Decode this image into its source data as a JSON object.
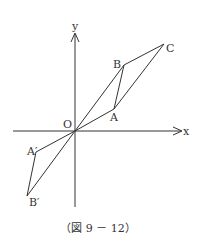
{
  "diagram": {
    "type": "coordinate-geometry",
    "caption": "（図 9 － 12）",
    "axes": {
      "x_label": "x",
      "y_label": "y",
      "origin_label": "O"
    },
    "points": {
      "A": {
        "label": "A",
        "px": [
          114,
          109
        ]
      },
      "B": {
        "label": "B",
        "px": [
          124,
          65
        ]
      },
      "C": {
        "label": "C",
        "px": [
          164,
          44
        ]
      },
      "A_prime": {
        "label": "A′",
        "px": [
          36,
          152
        ]
      },
      "B_prime": {
        "label": "B′",
        "px": [
          27,
          196
        ]
      },
      "O": {
        "label": "O",
        "px": [
          75,
          131
        ]
      }
    },
    "segments": [
      [
        "O",
        "A"
      ],
      [
        "O",
        "B"
      ],
      [
        "A",
        "B"
      ],
      [
        "B",
        "C"
      ],
      [
        "A",
        "C"
      ],
      [
        "O",
        "A_prime"
      ],
      [
        "O",
        "B_prime"
      ],
      [
        "A_prime",
        "B_prime"
      ]
    ],
    "colors": {
      "line": "#333333",
      "background": "#ffffff"
    }
  }
}
